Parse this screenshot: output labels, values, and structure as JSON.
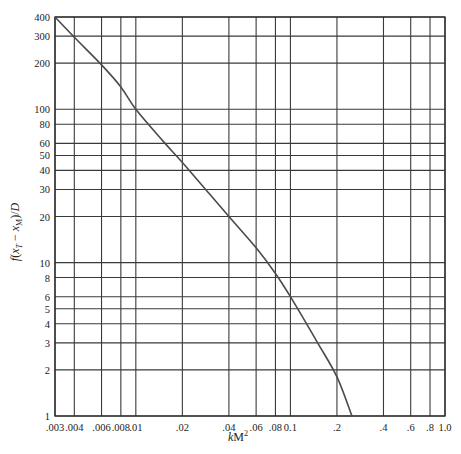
{
  "chart_data": {
    "type": "line",
    "title": "",
    "xlabel": "kM²",
    "ylabel": "f(x_T − x_M)/D",
    "xscale": "log",
    "yscale": "log",
    "xlim": [
      0.003,
      1.0
    ],
    "ylim": [
      1,
      400
    ],
    "grid": true,
    "legend": null,
    "x_ticks": [
      {
        "value": 0.003,
        "label": ".003"
      },
      {
        "value": 0.004,
        "label": ".004"
      },
      {
        "value": 0.006,
        "label": ".006"
      },
      {
        "value": 0.008,
        "label": ".008"
      },
      {
        "value": 0.01,
        "label": ".01"
      },
      {
        "value": 0.02,
        "label": ".02"
      },
      {
        "value": 0.04,
        "label": ".04"
      },
      {
        "value": 0.06,
        "label": ".06"
      },
      {
        "value": 0.08,
        "label": ".08"
      },
      {
        "value": 0.1,
        "label": "0.1"
      },
      {
        "value": 0.2,
        "label": ".2"
      },
      {
        "value": 0.4,
        "label": ".4"
      },
      {
        "value": 0.6,
        "label": ".6"
      },
      {
        "value": 0.8,
        "label": ".8"
      },
      {
        "value": 1.0,
        "label": "1.0"
      }
    ],
    "y_ticks": [
      {
        "value": 1,
        "label": "1"
      },
      {
        "value": 2,
        "label": "2"
      },
      {
        "value": 3,
        "label": "3"
      },
      {
        "value": 4,
        "label": "4"
      },
      {
        "value": 5,
        "label": "5"
      },
      {
        "value": 6,
        "label": "6"
      },
      {
        "value": 8,
        "label": "8"
      },
      {
        "value": 10,
        "label": "10"
      },
      {
        "value": 20,
        "label": "20"
      },
      {
        "value": 30,
        "label": "30"
      },
      {
        "value": 40,
        "label": "40"
      },
      {
        "value": 50,
        "label": "50"
      },
      {
        "value": 60,
        "label": "60"
      },
      {
        "value": 80,
        "label": "80"
      },
      {
        "value": 100,
        "label": "100"
      },
      {
        "value": 200,
        "label": "200"
      },
      {
        "value": 300,
        "label": "300"
      },
      {
        "value": 400,
        "label": "400"
      }
    ],
    "series": [
      {
        "name": "f(x_T − x_M)/D vs kM²",
        "x": [
          0.003,
          0.004,
          0.006,
          0.008,
          0.01,
          0.015,
          0.02,
          0.03,
          0.04,
          0.06,
          0.08,
          0.1,
          0.15,
          0.2,
          0.25
        ],
        "y": [
          400,
          295,
          195,
          140,
          100,
          62,
          45,
          28,
          20,
          12.5,
          8.5,
          6,
          3,
          1.8,
          1
        ]
      }
    ]
  },
  "layout": {
    "plot_left": 55,
    "plot_right": 445,
    "plot_top": 17,
    "plot_bottom": 416
  }
}
